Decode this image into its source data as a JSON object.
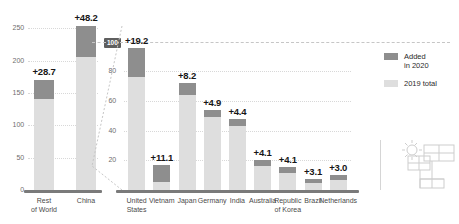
{
  "chart_data": {
    "type": "bar",
    "title": "",
    "subtitle": "",
    "xlabel": "",
    "ylabel": "",
    "stacked": true,
    "grid": true,
    "legend_position": "right",
    "panels": [
      {
        "name": "left-panel",
        "ylim": [
          0,
          260
        ],
        "yticks": [
          0,
          50,
          100,
          150,
          200,
          250
        ],
        "ytick_labels": [
          "0",
          "50",
          "100",
          "150",
          "200",
          "250"
        ],
        "categories": [
          "Rest\nof World",
          "China"
        ],
        "series": [
          {
            "name": "2019 total",
            "color": "#dedede",
            "values": [
              141.3,
              205.8
            ]
          },
          {
            "name": "Added in 2020",
            "color": "#8e8e8e",
            "values": [
              28.7,
              48.2
            ]
          }
        ],
        "data_labels": [
          "+28.7",
          "+48.2"
        ]
      },
      {
        "name": "right-panel",
        "ylim": [
          0,
          108
        ],
        "yticks": [
          20,
          40,
          60,
          80,
          100
        ],
        "ytick_labels": [
          "20",
          "40",
          "60",
          "80",
          "100"
        ],
        "highlight_tick": "100",
        "categories": [
          "United\nStates",
          "Vietnam",
          "Japan",
          "Germany",
          "India",
          "Australia",
          "Republic\nof Korea",
          "Brazil",
          "Netherlands"
        ],
        "series": [
          {
            "name": "2019 total",
            "color": "#dedede",
            "values": [
              76.4,
              5.7,
              63.9,
              49.3,
              43.3,
              15.9,
              11.2,
              4.5,
              6.9
            ]
          },
          {
            "name": "Added in 2020",
            "color": "#8e8e8e",
            "values": [
              19.2,
              11.1,
              8.2,
              4.9,
              4.4,
              4.1,
              4.1,
              3.1,
              3.0
            ]
          }
        ],
        "data_labels": [
          "+19.2",
          "+11.1",
          "+8.2",
          "+4.9",
          "+4.4",
          "+4.1",
          "+4.1",
          "+3.1",
          "+3.0"
        ]
      }
    ]
  },
  "legend": {
    "items": [
      {
        "label": "Added\nin 2020",
        "color": "#8e8e8e"
      },
      {
        "label": "2019 total",
        "color": "#dedede"
      }
    ]
  },
  "icon": {
    "name": "solar-panel-sun-icon"
  },
  "colors": {
    "added": "#8e8e8e",
    "total": "#dedede",
    "axis": "#7a7a7a",
    "grid": "#d8d8d8",
    "callout_bg": "#5f5f5f"
  }
}
